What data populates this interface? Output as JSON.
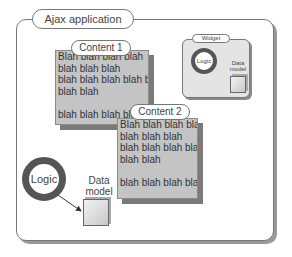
{
  "app": {
    "title": "Ajax application"
  },
  "content1": {
    "label": "Content 1",
    "lines": [
      "Blah blah blah blah",
      "blah blah blah",
      "blah blah blah blah blah",
      "blah blah",
      "",
      "blah blah blah blah"
    ]
  },
  "content2": {
    "label": "Content 2",
    "lines": [
      "Blah blah blah blah",
      "blah blah blah",
      "blah blah blah blah blah",
      "blah blah",
      "",
      "blah blah blah blah"
    ]
  },
  "widget": {
    "title": "Widget",
    "logic_label": "Logic",
    "data_model_label_1": "Data",
    "data_model_label_2": "model"
  },
  "main_components": {
    "logic_label": "Logic",
    "data_model_label_1": "Data",
    "data_model_label_2": "model"
  },
  "colors": {
    "content_fill": "#c4c4c4",
    "shadow": "#7a7a7a",
    "ring": "#555555"
  }
}
